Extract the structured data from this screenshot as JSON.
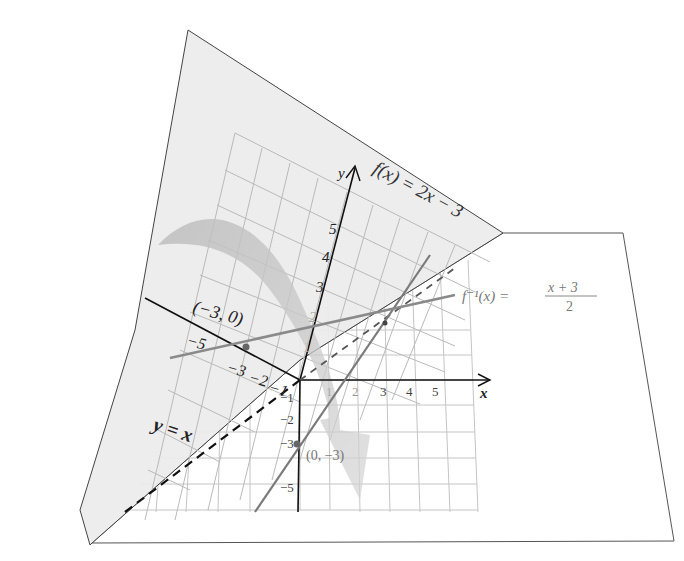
{
  "figure": {
    "function_label": "f(x) = 2x − 3",
    "inverse_label_lhs": "f⁻¹(x) =",
    "inverse_label_num": "x + 3",
    "inverse_label_den": "2",
    "mirror_label": "y = x",
    "point_fn": "(0, −3)",
    "point_inv": "(−3, 0)",
    "axis_x": "x",
    "axis_y": "y",
    "colors": {
      "front_plane": "#ffffff",
      "back_plane": "#ececec",
      "grid": "#b5b5b5",
      "axis": "#111111",
      "fn_line": "#7a7a7a",
      "inv_line": "#8a8a8a",
      "mirror": "#111111",
      "arrow": "#c8c8c8"
    }
  },
  "front_axes": {
    "x_ticks": [
      "1",
      "2",
      "3",
      "4",
      "5"
    ],
    "y_ticks": [
      "−1",
      "−2",
      "−3",
      "−5"
    ]
  },
  "back_axes": {
    "x_ticks": [
      "−5",
      "−3",
      "−2",
      "−1"
    ],
    "y_ticks": [
      "1",
      "2",
      "3",
      "4",
      "5"
    ]
  }
}
